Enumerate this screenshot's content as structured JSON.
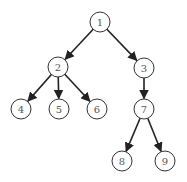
{
  "diagram": {
    "type": "tree",
    "colors": {
      "edge": "#222222",
      "node_stroke": "#333333",
      "node_fill": "#ffffff",
      "label": "#555555"
    },
    "node_radius": 10,
    "nodes": [
      {
        "id": "1",
        "label": "1",
        "x": 100,
        "y": 22
      },
      {
        "id": "2",
        "label": "2",
        "x": 58,
        "y": 67
      },
      {
        "id": "3",
        "label": "3",
        "x": 144,
        "y": 68
      },
      {
        "id": "4",
        "label": "4",
        "x": 21,
        "y": 109
      },
      {
        "id": "5",
        "label": "5",
        "x": 59,
        "y": 109
      },
      {
        "id": "6",
        "label": "6",
        "x": 97,
        "y": 109
      },
      {
        "id": "7",
        "label": "7",
        "x": 144,
        "y": 109
      },
      {
        "id": "8",
        "label": "8",
        "x": 122,
        "y": 161
      },
      {
        "id": "9",
        "label": "9",
        "x": 165,
        "y": 161
      }
    ],
    "edges": [
      {
        "from": "1",
        "to": "2"
      },
      {
        "from": "1",
        "to": "3"
      },
      {
        "from": "2",
        "to": "4"
      },
      {
        "from": "2",
        "to": "5"
      },
      {
        "from": "2",
        "to": "6"
      },
      {
        "from": "3",
        "to": "7"
      },
      {
        "from": "7",
        "to": "8"
      },
      {
        "from": "7",
        "to": "9"
      }
    ]
  }
}
